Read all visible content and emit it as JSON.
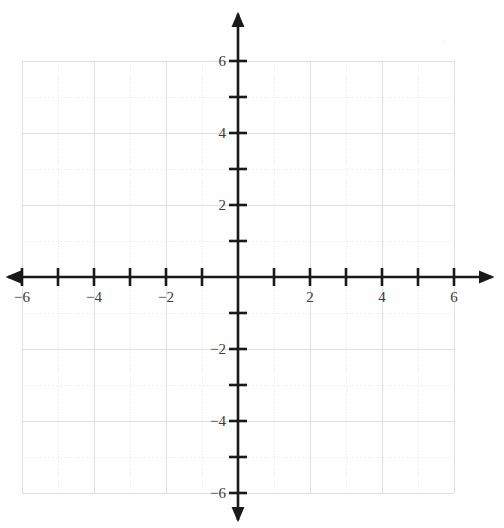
{
  "figure": {
    "title": "",
    "background_color": "#fefefe",
    "width": 504,
    "height": 528
  },
  "chart_data": {
    "type": "scatter",
    "title": "",
    "subtitle": "",
    "xlabel": "",
    "ylabel": "",
    "xlim": [
      -6,
      6
    ],
    "ylim": [
      -6,
      6
    ],
    "grid": true,
    "grid_step": 1,
    "legend": null,
    "series": [],
    "x": [],
    "y": [],
    "annotations": [],
    "x_ticks": [
      -6,
      -5,
      -4,
      -3,
      -2,
      -1,
      0,
      1,
      2,
      3,
      4,
      5,
      6
    ],
    "y_ticks": [
      -6,
      -5,
      -4,
      -3,
      -2,
      -1,
      0,
      1,
      2,
      3,
      4,
      5,
      6
    ],
    "x_tick_labels": [
      {
        "value": -6,
        "text": "−6"
      },
      {
        "value": -4,
        "text": "−4"
      },
      {
        "value": -2,
        "text": "−2"
      },
      {
        "value": 2,
        "text": "2"
      },
      {
        "value": 4,
        "text": "4"
      },
      {
        "value": 6,
        "text": "6"
      }
    ],
    "y_tick_labels": [
      {
        "value": 6,
        "text": "6"
      },
      {
        "value": 4,
        "text": "4"
      },
      {
        "value": 2,
        "text": "2"
      },
      {
        "value": -2,
        "text": "−2"
      },
      {
        "value": -4,
        "text": "−4"
      },
      {
        "value": -6,
        "text": "−6"
      }
    ]
  },
  "geometry": {
    "origin_x": 238,
    "origin_y": 277,
    "unit_px": 36,
    "grid_min": -6,
    "grid_max": 6,
    "x_axis_start_px": 8,
    "x_axis_end_px": 492,
    "y_axis_start_px": 14,
    "y_axis_end_px": 520,
    "tick_half_len": 9
  },
  "style": {
    "axis_color": "#1a1a1a",
    "grid_color": "#d8d8d8",
    "grid_color_faint": "#e6e6e6",
    "label_color": "#3a3a3a",
    "axis_width": 2.6,
    "tick_width": 2.6,
    "grid_width": 0.8
  },
  "accessibility": {
    "axis_x_name": "x-axis",
    "axis_y_name": "y-axis",
    "plot_area_name": "coordinate-plane"
  }
}
